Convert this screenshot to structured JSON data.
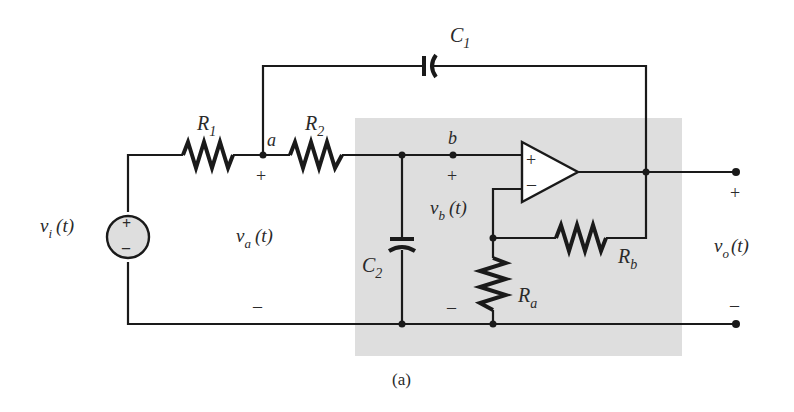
{
  "figure": {
    "caption": "(a)",
    "shade_color": "#dedede",
    "wire_color": "#1a1a1a"
  },
  "components": {
    "R1": {
      "name": "R",
      "sub": "1"
    },
    "R2": {
      "name": "R",
      "sub": "2"
    },
    "C1": {
      "name": "C",
      "sub": "1"
    },
    "C2": {
      "name": "C",
      "sub": "2"
    },
    "Ra": {
      "name": "R",
      "sub": "a"
    },
    "Rb": {
      "name": "R",
      "sub": "b"
    }
  },
  "nodes": {
    "a": "a",
    "b": "b"
  },
  "voltages": {
    "vi": {
      "name": "v",
      "sub": "i",
      "arg": "(t)"
    },
    "va": {
      "name": "v",
      "sub": "a",
      "arg": "(t)",
      "plus": "+",
      "minus": "–"
    },
    "vb": {
      "name": "v",
      "sub": "b",
      "arg": "(t)",
      "plus": "+",
      "minus": "–"
    },
    "vo": {
      "name": "v",
      "sub": "o",
      "arg": "(t)",
      "plus": "+",
      "minus": "–"
    }
  },
  "source": {
    "plus": "+",
    "minus": "–"
  },
  "opamp": {
    "plus": "+",
    "minus": "–"
  }
}
